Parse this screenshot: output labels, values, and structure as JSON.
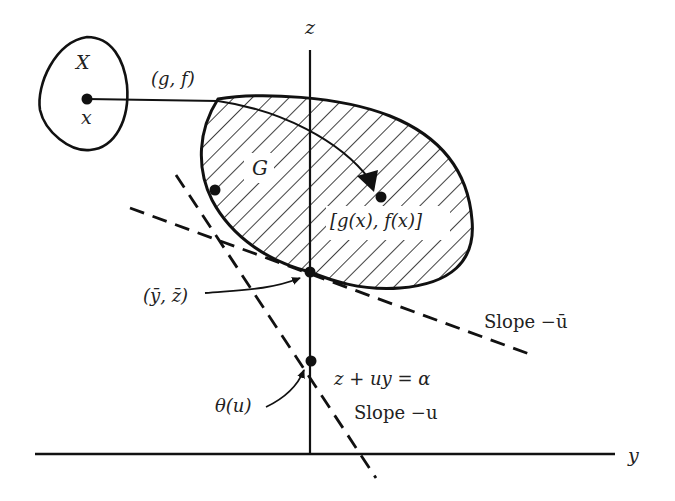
{
  "figure": {
    "type": "geometric-duality-diagram",
    "axes": {
      "vertical_label": "z",
      "horizontal_label": "y"
    },
    "domain_set": {
      "label": "X",
      "point_label": "x"
    },
    "mapping_label": "(g, f)",
    "image_set": {
      "label": "G",
      "point_label": "[g(x), f(x)]"
    },
    "supporting_point_label": "(ȳ, z̄)",
    "supporting_line": {
      "label": "Slope −ū"
    },
    "intercept_label": "θ(u)",
    "line_equation": "z + uy = α",
    "line_slope_label": "Slope −u"
  },
  "colors": {
    "ink": "#111111",
    "background": "#ffffff"
  }
}
